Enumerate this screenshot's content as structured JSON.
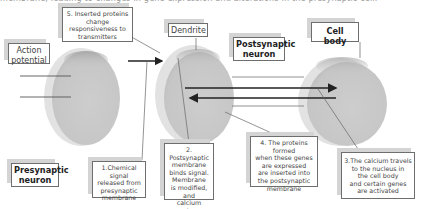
{
  "caption": "membrane, leading to changes in gene expression and alterations in the presynaptic cell.",
  "colors": {
    "cell_fill": "#c9c9c9",
    "cell_highlight": "#e6e6e6",
    "cell_top_shadow": "#a8a8a8",
    "line": "#333333",
    "box_border": "#6e6e6e",
    "box_shadow": "#d4d4d4"
  },
  "labels": {
    "action_potential": "Action\npotential",
    "dendrite": "Dendrite",
    "postsynaptic_neuron": "Postsynaptic\nneuron",
    "cell_body": "Cell body",
    "presynaptic_neuron": "Presynaptic\nneuron"
  },
  "steps": {
    "step1": "1.Chemical signal\nreleased from\npresynaptic\nmembrane",
    "step2": "2. Postsynaptic\nmembrane\nbinds signal.\nMembrane\nis modified, and\ncalcium enters\nthe cell",
    "step3": "3.The calcium travels\nto the nucleus in\nthe cell body\nand certain genes\nare activated",
    "step4": "4. The proteins formed\nwhen these genes\nare expressed\nare inserted into\nthe postsynaptic\nmembrane",
    "step5": "5. Inserted proteins\nchange\nresponsiveness to\ntransmitters"
  },
  "cells": [
    {
      "name": "presynaptic-terminal",
      "cx": 85,
      "cy": 97,
      "rx": 37,
      "ry": 48
    },
    {
      "name": "dendrite-cell",
      "cx": 198,
      "cy": 95,
      "rx": 38,
      "ry": 50
    },
    {
      "name": "cell-body",
      "cx": 345,
      "cy": 102,
      "rx": 42,
      "ry": 45
    }
  ]
}
